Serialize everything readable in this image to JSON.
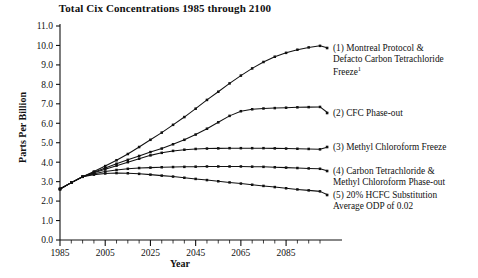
{
  "chart_data": {
    "type": "line",
    "title": "Total Cix Concentrations 1985 through 2100",
    "xlabel": "Year",
    "ylabel": "Parts Per Billion",
    "xlim": [
      1985,
      2100
    ],
    "ylim": [
      0.0,
      11.0
    ],
    "grid": false,
    "legend_position": "right-inline",
    "x_ticks_major": [
      1985,
      2005,
      2025,
      2045,
      2065,
      2085
    ],
    "x_tick_labels": [
      "1985",
      "2005",
      "2025",
      "2045",
      "2065",
      "2085"
    ],
    "x_tick_minor_step": 5,
    "y_ticks": [
      0.0,
      1.0,
      2.0,
      3.0,
      4.0,
      5.0,
      6.0,
      7.0,
      8.0,
      9.0,
      10.0,
      11.0
    ],
    "y_tick_labels": [
      "0.0",
      "1.0",
      "2.0",
      "3.0",
      "4.0",
      "5.0",
      "6.0",
      "7.0",
      "8.0",
      "9.0",
      "10.0",
      "11.0"
    ],
    "x": [
      1985,
      1990,
      1995,
      2000,
      2005,
      2010,
      2015,
      2020,
      2025,
      2030,
      2035,
      2040,
      2045,
      2050,
      2055,
      2060,
      2065,
      2070,
      2075,
      2080,
      2085,
      2090,
      2095,
      2100
    ],
    "series": [
      {
        "name": "(1) Montreal Protocol & Defacto Carbon Tetrachloride Freeze",
        "label_number": "1",
        "values": [
          2.62,
          2.95,
          3.25,
          3.52,
          3.8,
          4.1,
          4.42,
          4.78,
          5.15,
          5.52,
          5.92,
          6.32,
          6.75,
          7.2,
          7.62,
          8.05,
          8.45,
          8.82,
          9.15,
          9.42,
          9.62,
          9.78,
          9.9,
          9.98
        ]
      },
      {
        "name": "(2) CFC Phase-out",
        "label_number": "2",
        "values": [
          2.62,
          2.95,
          3.25,
          3.48,
          3.7,
          3.92,
          4.12,
          4.32,
          4.52,
          4.7,
          4.92,
          5.15,
          5.42,
          5.72,
          6.05,
          6.38,
          6.62,
          6.72,
          6.76,
          6.78,
          6.8,
          6.82,
          6.83,
          6.84
        ]
      },
      {
        "name": "(3) Methyl Chloroform Freeze",
        "label_number": "3",
        "values": [
          2.62,
          2.95,
          3.25,
          3.46,
          3.64,
          3.82,
          4.0,
          4.18,
          4.35,
          4.48,
          4.58,
          4.64,
          4.68,
          4.7,
          4.71,
          4.72,
          4.72,
          4.72,
          4.72,
          4.71,
          4.7,
          4.69,
          4.68,
          4.66
        ]
      },
      {
        "name": "(4) Carbon Tetrachloride & Methyl Chloroform Phase-out",
        "label_number": "4",
        "values": [
          2.62,
          2.95,
          3.25,
          3.4,
          3.52,
          3.6,
          3.66,
          3.7,
          3.72,
          3.74,
          3.75,
          3.76,
          3.77,
          3.78,
          3.78,
          3.78,
          3.78,
          3.77,
          3.76,
          3.74,
          3.72,
          3.7,
          3.68,
          3.66
        ]
      },
      {
        "name": "(5) 20% HCFC Substitution Average ODP of 0.02",
        "label_number": "5",
        "values": [
          2.62,
          2.95,
          3.25,
          3.36,
          3.42,
          3.44,
          3.43,
          3.4,
          3.36,
          3.31,
          3.26,
          3.2,
          3.14,
          3.08,
          3.02,
          2.96,
          2.9,
          2.84,
          2.78,
          2.72,
          2.66,
          2.6,
          2.55,
          2.5
        ]
      }
    ],
    "legend": [
      {
        "id": "legend-1",
        "lines": [
          "(1) Montreal Protocol &",
          "Defacto Carbon Tetrachloride",
          "Freeze"
        ],
        "superscript": "1"
      },
      {
        "id": "legend-2",
        "lines": [
          "(2) CFC Phase-out"
        ],
        "superscript": ""
      },
      {
        "id": "legend-3",
        "lines": [
          "(3) Methyl Chloroform Freeze"
        ],
        "superscript": ""
      },
      {
        "id": "legend-4",
        "lines": [
          "(4) Carbon Tetrachloride &",
          "Methyl Chloroform Phase-out"
        ],
        "superscript": ""
      },
      {
        "id": "legend-5",
        "lines": [
          "(5) 20% HCFC Substitution",
          "Average ODP of 0.02"
        ],
        "superscript": ""
      }
    ],
    "colors": {
      "line": "#111111",
      "marker": "#111111",
      "axis": "#111111",
      "background": "#ffffff"
    }
  }
}
